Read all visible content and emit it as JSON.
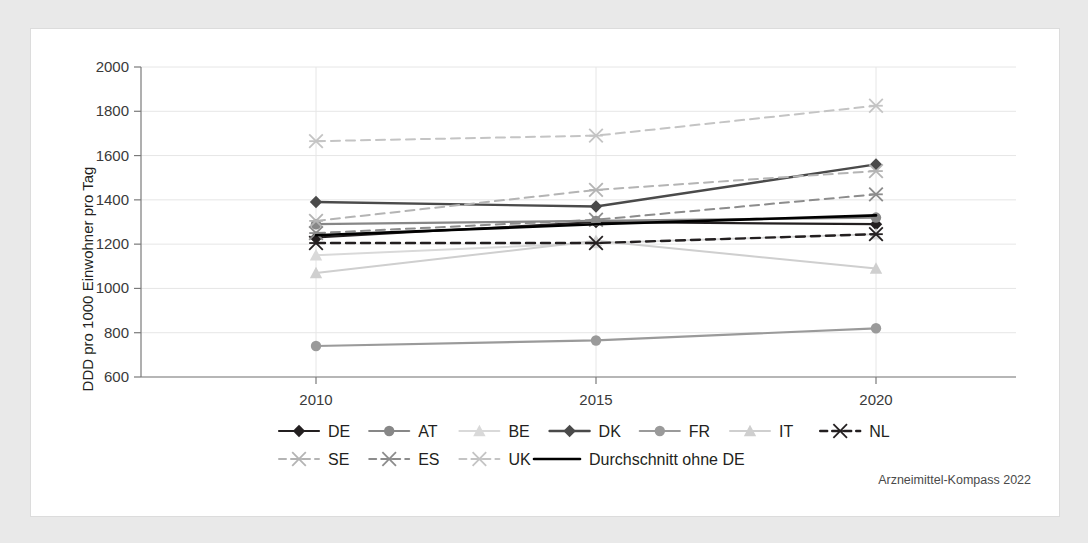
{
  "source_note": "Arzneimittel-Kompass 2022",
  "axes": {
    "ylabel": "DDD pro 1000 Einwohner pro Tag",
    "yticks": [
      "2000",
      "1800",
      "1600",
      "1400",
      "1200",
      "1000",
      "800",
      "600"
    ],
    "xticks": [
      "2010",
      "2015",
      "2020"
    ]
  },
  "legend": {
    "row1": [
      {
        "label": "DE"
      },
      {
        "label": "AT"
      },
      {
        "label": "BE"
      },
      {
        "label": "DK"
      },
      {
        "label": "FR"
      },
      {
        "label": "IT"
      },
      {
        "label": "NL"
      }
    ],
    "row2": [
      {
        "label": "SE"
      },
      {
        "label": "ES"
      },
      {
        "label": "UK"
      },
      {
        "label": "Durchschnitt ohne DE"
      }
    ]
  },
  "chart_data": {
    "type": "line",
    "title": "",
    "xlabel": "",
    "ylabel": "DDD pro 1000 Einwohner pro Tag",
    "x": [
      2010,
      2015,
      2020
    ],
    "ylim": [
      600,
      2000
    ],
    "ytick_step": 200,
    "grid": true,
    "legend_position": "bottom",
    "series": [
      {
        "name": "DE",
        "values": [
          1230,
          1300,
          1290
        ],
        "color": "#231f20",
        "dash": "solid",
        "marker": "diamond",
        "width": 2.2
      },
      {
        "name": "AT",
        "values": [
          1290,
          1305,
          1320
        ],
        "color": "#878787",
        "dash": "solid",
        "marker": "circle",
        "width": 2.2
      },
      {
        "name": "BE",
        "values": [
          1150,
          1205,
          1245
        ],
        "color": "#d9d9d9",
        "dash": "solid",
        "marker": "triangle",
        "width": 2.0
      },
      {
        "name": "DK",
        "values": [
          1390,
          1370,
          1560
        ],
        "color": "#4a4a4a",
        "dash": "solid",
        "marker": "diamond",
        "width": 2.4
      },
      {
        "name": "FR",
        "values": [
          740,
          765,
          820
        ],
        "color": "#9a9a9a",
        "dash": "solid",
        "marker": "circle",
        "width": 2.2
      },
      {
        "name": "IT",
        "values": [
          1070,
          1215,
          1090
        ],
        "color": "#cfcfcf",
        "dash": "solid",
        "marker": "triangle",
        "width": 2.0
      },
      {
        "name": "NL",
        "values": [
          1205,
          1205,
          1245
        ],
        "color": "#231f20",
        "dash": "dashed",
        "marker": "asterisk",
        "width": 2.4
      },
      {
        "name": "SE",
        "values": [
          1305,
          1445,
          1530
        ],
        "color": "#b4b4b4",
        "dash": "dashed",
        "marker": "asterisk",
        "width": 2.0
      },
      {
        "name": "ES",
        "values": [
          1250,
          1310,
          1425
        ],
        "color": "#8c8c8c",
        "dash": "dashed",
        "marker": "asterisk",
        "width": 2.0
      },
      {
        "name": "UK",
        "values": [
          1665,
          1690,
          1825
        ],
        "color": "#c4c4c4",
        "dash": "dashed",
        "marker": "asterisk",
        "width": 2.0
      },
      {
        "name": "Durchschnitt ohne DE",
        "values": [
          1240,
          1290,
          1330
        ],
        "color": "#000000",
        "dash": "solid",
        "marker": "none",
        "width": 2.6
      }
    ]
  }
}
